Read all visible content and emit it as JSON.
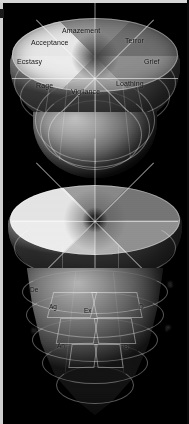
{
  "figure": {
    "background_color": "#000000",
    "panel_count": 3,
    "corner_marker": "a"
  },
  "panels": [
    {
      "id": "cone-labeled",
      "name": "primary-emotion-cone",
      "sector_count": 8,
      "labels": [
        {
          "key": "amazement",
          "text": "Amazement"
        },
        {
          "key": "terror",
          "text": "Terror"
        },
        {
          "key": "grief",
          "text": "Grief"
        },
        {
          "key": "loathing",
          "text": "Loathing"
        },
        {
          "key": "vigilance",
          "text": "Vigilance"
        },
        {
          "key": "rage",
          "text": "Rage"
        },
        {
          "key": "ecstasy",
          "text": "Ecstasy"
        },
        {
          "key": "acceptance",
          "text": "Acceptance"
        }
      ]
    },
    {
      "id": "cone-plain",
      "name": "unlabeled-emotion-cone",
      "sector_count": 8,
      "labels": []
    },
    {
      "id": "cone-abbreviated",
      "name": "abbreviated-emotion-cone",
      "sector_count": 8,
      "labels": [
        {
          "key": "de",
          "text": "De"
        },
        {
          "key": "s",
          "text": "S"
        },
        {
          "key": "ag",
          "text": "Ag"
        },
        {
          "key": "ex",
          "text": "Ex"
        },
        {
          "key": "d",
          "text": "D"
        },
        {
          "key": "h",
          "text": "H"
        },
        {
          "key": "p",
          "text": "P"
        },
        {
          "key": "an",
          "text": "An"
        },
        {
          "key": "b",
          "text": "B"
        }
      ]
    }
  ],
  "colors": {
    "background": "#000000",
    "label_text": "#101010",
    "grid_line": "#ffffff",
    "page_edge": "#cfcfcf"
  }
}
